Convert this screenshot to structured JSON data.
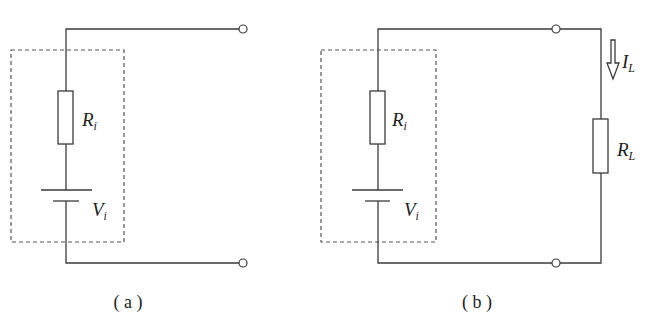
{
  "figure": {
    "panels": [
      {
        "id": "a",
        "caption": "( a )",
        "components": {
          "internal_resistor": {
            "symbol": "R",
            "subscript": "i"
          },
          "source": {
            "symbol": "V",
            "subscript": "i"
          }
        },
        "terminals": 2
      },
      {
        "id": "b",
        "caption": "( b )",
        "components": {
          "internal_resistor": {
            "symbol": "R",
            "subscript": "i"
          },
          "source": {
            "symbol": "V",
            "subscript": "i"
          },
          "load_resistor": {
            "symbol": "R",
            "subscript": "L"
          },
          "load_current": {
            "symbol": "I",
            "subscript": "L"
          }
        },
        "terminals": 2
      }
    ],
    "colors": {
      "line": "#3a3a3a",
      "dashed_box": "#555555",
      "background": "#ffffff"
    }
  }
}
